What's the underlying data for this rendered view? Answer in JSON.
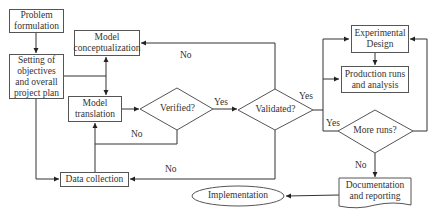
{
  "diagram": {
    "type": "flowchart",
    "nodes": {
      "problem_formulation": "Problem formulation",
      "setting_objectives": "Setting of objectives and overall project plan",
      "model_conceptualization": "Model conceptualization",
      "model_translation": "Model translation",
      "verified": "Verified?",
      "validated": "Validated?",
      "experimental_design": "Experimental Design",
      "production_runs": "Production runs and analysis",
      "more_runs": "More runs?",
      "documentation": "Documentation and reporting",
      "implementation": "Implementation",
      "data_collection": "Data collection"
    },
    "edge_labels": {
      "validated_no_to_conceptualization": "No",
      "verified_yes": "Yes",
      "verified_no": "No",
      "validated_yes": "Yes",
      "validated_no_to_data": "No",
      "more_runs_yes": "Yes",
      "more_runs_no": "No"
    },
    "edges": [
      {
        "from": "Problem formulation",
        "to": "Setting of objectives and overall project plan"
      },
      {
        "from": "Setting of objectives and overall project plan",
        "to": "Model conceptualization"
      },
      {
        "from": "Setting of objectives and overall project plan",
        "to": "Model translation"
      },
      {
        "from": "Setting of objectives and overall project plan",
        "to": "Data collection"
      },
      {
        "from": "Model conceptualization",
        "to": "Model translation"
      },
      {
        "from": "Data collection",
        "to": "Model translation"
      },
      {
        "from": "Model translation",
        "to": "Verified?"
      },
      {
        "from": "Verified?",
        "to": "Validated?",
        "label": "Yes"
      },
      {
        "from": "Verified?",
        "to": "Model translation",
        "label": "No"
      },
      {
        "from": "Validated?",
        "to": "Model conceptualization",
        "label": "No"
      },
      {
        "from": "Validated?",
        "to": "Data collection",
        "label": "No"
      },
      {
        "from": "Validated?",
        "to": "Experimental Design",
        "label": "Yes"
      },
      {
        "from": "Validated?",
        "to": "Production runs and analysis",
        "label": "Yes"
      },
      {
        "from": "Experimental Design",
        "to": "Production runs and analysis"
      },
      {
        "from": "More runs?",
        "to": "Experimental Design",
        "label": "Yes"
      },
      {
        "from": "More runs?",
        "to": "Documentation and reporting",
        "label": "No"
      },
      {
        "from": "Documentation and reporting",
        "to": "Implementation"
      }
    ]
  }
}
